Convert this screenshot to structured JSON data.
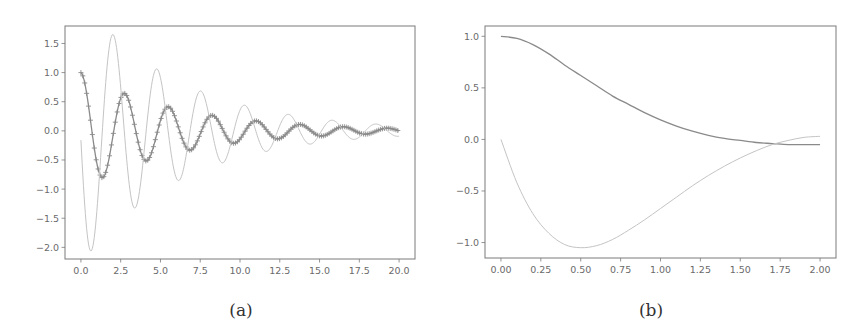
{
  "captions": {
    "a": "(a)",
    "b": "(b)"
  },
  "colors": {
    "frame": "#7a7a7a",
    "tick_text": "#6a6a6a",
    "curve_dark": "#8a8a8a",
    "curve_light": "#c4c4c4",
    "background": "#ffffff"
  },
  "chart_data": [
    {
      "type": "line",
      "panel": "a",
      "title": "",
      "xlabel": "",
      "ylabel": "",
      "xlim": [
        -1.0,
        21.0
      ],
      "ylim": [
        -2.2,
        1.8
      ],
      "xticks": [
        0.0,
        2.5,
        5.0,
        7.5,
        10.0,
        12.5,
        15.0,
        17.5,
        20.0
      ],
      "xtick_labels": [
        "0.0",
        "2.5",
        "5.0",
        "7.5",
        "10.0",
        "12.5",
        "15.0",
        "17.5",
        "20.0"
      ],
      "yticks": [
        1.5,
        1.0,
        0.5,
        0.0,
        -0.5,
        -1.0,
        -1.5,
        -2.0
      ],
      "ytick_labels": [
        "1.5",
        "1.0",
        "0.5",
        "0.0",
        "−0.5",
        "−1.0",
        "−1.5",
        "−2.0"
      ],
      "grid": false,
      "legend": null,
      "series": [
        {
          "name": "position (+ markers)",
          "style": "dark line with + markers",
          "model": "x(t) = exp(-0.16 t) cos(2.3 t), t in [0, 20]",
          "extrema": [
            [
              0.0,
              1.0
            ],
            [
              1.3,
              -0.8
            ],
            [
              2.75,
              0.65
            ],
            [
              4.1,
              -0.5
            ],
            [
              5.5,
              0.42
            ],
            [
              6.9,
              -0.33
            ],
            [
              8.3,
              0.28
            ],
            [
              9.65,
              -0.21
            ],
            [
              11.1,
              0.19
            ],
            [
              12.5,
              -0.14
            ],
            [
              13.9,
              0.13
            ],
            [
              15.3,
              -0.08
            ],
            [
              16.7,
              0.08
            ],
            [
              18.2,
              -0.04
            ],
            [
              20.0,
              0.06
            ]
          ]
        },
        {
          "name": "velocity",
          "style": "light line",
          "model": "v(t) = dx/dt",
          "extrema": [
            [
              0.0,
              0.0
            ],
            [
              0.6,
              -1.97
            ],
            [
              2.0,
              1.62
            ],
            [
              3.4,
              -1.29
            ],
            [
              4.8,
              1.07
            ],
            [
              6.2,
              -0.84
            ],
            [
              7.6,
              0.68
            ],
            [
              9.0,
              -0.55
            ],
            [
              10.4,
              0.45
            ],
            [
              11.8,
              -0.36
            ],
            [
              13.3,
              0.3
            ],
            [
              14.7,
              -0.22
            ],
            [
              16.1,
              0.2
            ],
            [
              17.5,
              -0.15
            ],
            [
              18.9,
              0.14
            ],
            [
              20.0,
              -0.02
            ]
          ]
        }
      ]
    },
    {
      "type": "line",
      "panel": "b",
      "title": "",
      "xlabel": "",
      "ylabel": "",
      "xlim": [
        -0.1,
        2.1
      ],
      "ylim": [
        -1.15,
        1.1
      ],
      "xticks": [
        0.0,
        0.25,
        0.5,
        0.75,
        1.0,
        1.25,
        1.5,
        1.75,
        2.0
      ],
      "xtick_labels": [
        "0.00",
        "0.25",
        "0.50",
        "0.75",
        "1.00",
        "1.25",
        "1.50",
        "1.75",
        "2.00"
      ],
      "yticks": [
        1.0,
        0.5,
        0.0,
        -0.5,
        -1.0
      ],
      "ytick_labels": [
        "1.0",
        "0.5",
        "0.0",
        "−0.5",
        "−1.0"
      ],
      "grid": false,
      "legend": null,
      "series": [
        {
          "name": "position",
          "style": "dark line",
          "x": [
            0.0,
            0.1,
            0.2,
            0.3,
            0.4,
            0.5,
            0.6,
            0.7,
            0.8,
            0.9,
            1.0,
            1.1,
            1.2,
            1.3,
            1.4,
            1.5,
            1.6,
            1.7,
            1.8,
            1.9,
            2.0
          ],
          "y": [
            1.0,
            0.98,
            0.92,
            0.83,
            0.72,
            0.62,
            0.52,
            0.42,
            0.34,
            0.26,
            0.19,
            0.13,
            0.08,
            0.04,
            0.01,
            -0.01,
            -0.03,
            -0.04,
            -0.05,
            -0.05,
            -0.05
          ]
        },
        {
          "name": "velocity",
          "style": "light line",
          "x": [
            0.0,
            0.1,
            0.2,
            0.3,
            0.4,
            0.5,
            0.6,
            0.7,
            0.8,
            0.9,
            1.0,
            1.1,
            1.2,
            1.3,
            1.4,
            1.5,
            1.6,
            1.7,
            1.8,
            1.9,
            2.0
          ],
          "y": [
            0.0,
            -0.42,
            -0.72,
            -0.91,
            -1.02,
            -1.05,
            -1.03,
            -0.97,
            -0.88,
            -0.78,
            -0.67,
            -0.56,
            -0.45,
            -0.35,
            -0.26,
            -0.18,
            -0.11,
            -0.05,
            -0.01,
            0.02,
            0.03
          ]
        }
      ]
    }
  ]
}
